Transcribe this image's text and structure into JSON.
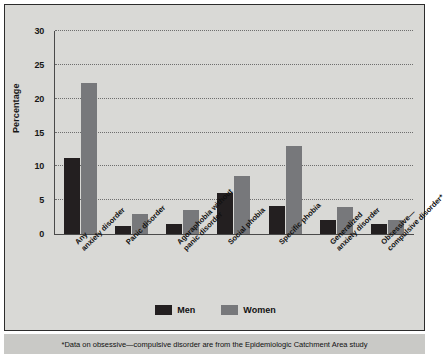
{
  "chart_data": {
    "type": "bar",
    "title": "",
    "xlabel": "",
    "ylabel": "Percentage",
    "ylim": [
      0,
      30
    ],
    "yticks": [
      0,
      5,
      10,
      15,
      20,
      25,
      30
    ],
    "grid": true,
    "legend_position": "bottom",
    "categories": [
      "Any anxiety disorder",
      "Panic disorder",
      "Agoraphobia without panic disorder",
      "Social phobia",
      "Specific phobia",
      "Generalized anxiety disorder",
      "Obsessive—compulsive disorder*"
    ],
    "category_lines": [
      [
        "Any",
        "anxiety disorder"
      ],
      [
        "Panic disorder",
        ""
      ],
      [
        "Agoraphobia without",
        "panic disorder"
      ],
      [
        "Social phobia",
        ""
      ],
      [
        "Specific phobia",
        ""
      ],
      [
        "Generalized",
        "anxiety disorder"
      ],
      [
        "Obsessive—",
        "compulsive disorder*"
      ]
    ],
    "series": [
      {
        "name": "Men",
        "color": "#231f20",
        "values": [
          11.3,
          1.2,
          1.5,
          6.0,
          4.1,
          2.0,
          1.5
        ]
      },
      {
        "name": "Women",
        "color": "#77787b",
        "values": [
          22.3,
          3.0,
          3.5,
          8.5,
          13.0,
          4.0,
          2.1
        ]
      }
    ],
    "footnote": "*Data on obsessive—compulsive disorder are from the Epidemiologic Catchment Area study"
  },
  "colors": {
    "men": "#231f20",
    "women": "#77787b",
    "panel_background": "#d9d9d6",
    "footnote_background": "#c9c9c6",
    "axis": "#4a4a4a",
    "gridline": "#6e6e6e",
    "text": "#111111"
  }
}
